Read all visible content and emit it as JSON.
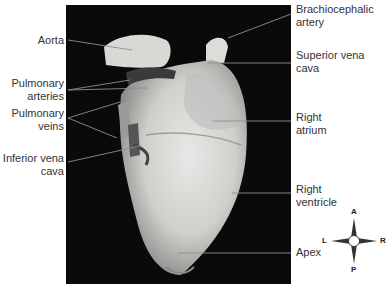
{
  "figure": {
    "labels_left": [
      {
        "id": "aorta",
        "text": "Aorta"
      },
      {
        "id": "pulmonary-arteries",
        "text": "Pulmonary arteries"
      },
      {
        "id": "pulmonary-veins",
        "text": "Pulmonary veins"
      },
      {
        "id": "inferior-vena-cava",
        "text": "Inferior vena cava"
      }
    ],
    "labels_right": [
      {
        "id": "brachiocephalic-artery",
        "text": "Brachiocephalic artery"
      },
      {
        "id": "superior-vena-cava",
        "text": "Superior vena cava"
      },
      {
        "id": "right-atrium",
        "text": "Right atrium"
      },
      {
        "id": "right-ventricle",
        "text": "Right ventricle"
      },
      {
        "id": "apex",
        "text": "Apex"
      }
    ],
    "compass": {
      "top": "A",
      "bottom": "P",
      "left": "L",
      "right": "R"
    }
  }
}
